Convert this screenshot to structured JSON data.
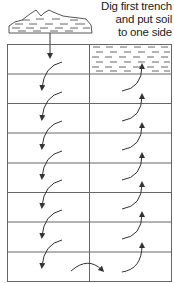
{
  "caption": {
    "lines": [
      "Dig first trench",
      "and put soil",
      "to one side"
    ]
  },
  "diagram": {
    "rows": 8,
    "columns": 2,
    "grid": {
      "left": 7,
      "top": 44,
      "right": 172,
      "bottom": 282,
      "divider_x": 89
    },
    "first_trench_filled": true,
    "colors": {
      "line": "#555555",
      "fill": "#ffffff",
      "dash": "#444444"
    }
  },
  "icons": [
    "soil-pile-icon",
    "down-arrow-icon",
    "curved-arrow-icon"
  ]
}
